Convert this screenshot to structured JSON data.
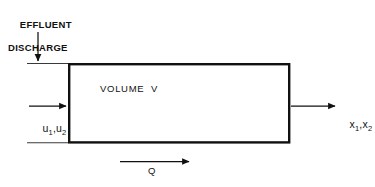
{
  "diagram": {
    "type": "schematic",
    "background_color": "#ffffff",
    "stroke_color": "#111111",
    "canvas": {
      "width": 375,
      "height": 187
    },
    "labels": {
      "effluent_line1": "EFFLUENT",
      "effluent_line2": "DISCHARGE",
      "volume": "VOLUME  V",
      "inflow_symbol": "u",
      "inflow_sub_1": "1",
      "inflow_sub_2": "2",
      "inflow_separator": ",",
      "outflow_symbol": "x",
      "outflow_sub_1": "1",
      "outflow_sub_2": "2",
      "outflow_separator": ",",
      "flow_rate": "Q"
    },
    "elements": {
      "reactor_box": {
        "x": 68,
        "y": 63,
        "width": 222,
        "height": 80,
        "stroke_width": 2.4
      },
      "channel_top_line": {
        "x1": 27,
        "y1": 63,
        "x2": 68,
        "y2": 63,
        "stroke_width": 1
      },
      "channel_bottom_line": {
        "x1": 27,
        "y1": 143,
        "x2": 68,
        "y2": 143,
        "stroke_width": 1
      },
      "effluent_arrow": {
        "x1": 38,
        "y1": 33,
        "x2": 38,
        "y2": 62,
        "direction": "down"
      },
      "inflow_arrow": {
        "x1": 29,
        "y1": 106,
        "x2": 67,
        "y2": 106,
        "direction": "right"
      },
      "outflow_arrow": {
        "x1": 291,
        "y1": 106,
        "x2": 336,
        "y2": 106,
        "direction": "right"
      },
      "flow_arrow": {
        "x1": 120,
        "y1": 162,
        "x2": 190,
        "y2": 162,
        "direction": "right"
      }
    }
  }
}
